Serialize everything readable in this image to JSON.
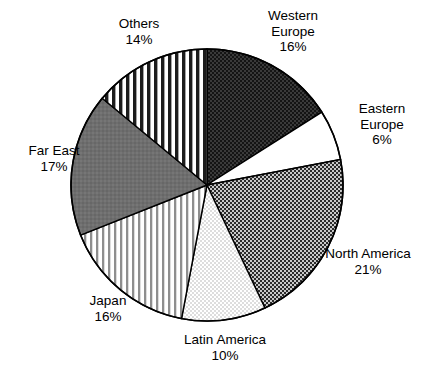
{
  "chart_data": {
    "type": "pie",
    "title": "",
    "subtitle": "",
    "xlabel": "",
    "ylabel": "",
    "legend_position": "none",
    "grid": false,
    "value_suffix": "%",
    "start_angle_deg": 0,
    "direction": "clockwise",
    "categories": [
      "Western Europe",
      "Eastern Europe",
      "North America",
      "Latin America",
      "Japan",
      "Far East",
      "Others"
    ],
    "values": [
      16,
      6,
      21,
      10,
      16,
      17,
      14
    ],
    "slices": [
      {
        "key": "western-europe",
        "label": "Western Europe",
        "label_line1": "Western",
        "label_line2": "Europe",
        "value": 16,
        "value_text": "16%",
        "fill_pattern": "dense-dark-checkerboard",
        "fill_color": "#444444",
        "start_pct": 0,
        "end_pct": 16
      },
      {
        "key": "eastern-europe",
        "label": "Eastern Europe",
        "label_line1": "Eastern",
        "label_line2": "Europe",
        "value": 6,
        "value_text": "6%",
        "fill_pattern": "solid-white",
        "fill_color": "#ffffff",
        "start_pct": 16,
        "end_pct": 22
      },
      {
        "key": "north-america",
        "label": "North America",
        "label_line1": "North America",
        "label_line2": "",
        "value": 21,
        "value_text": "21%",
        "fill_pattern": "medium-checkerboard",
        "fill_color": "#6f6f6f",
        "start_pct": 22,
        "end_pct": 43
      },
      {
        "key": "latin-america",
        "label": "Latin America",
        "label_line1": "Latin America",
        "label_line2": "",
        "value": 10,
        "value_text": "10%",
        "fill_pattern": "light-dots",
        "fill_color": "#d8d8d8",
        "start_pct": 43,
        "end_pct": 53
      },
      {
        "key": "japan",
        "label": "Japan",
        "label_line1": "Japan",
        "label_line2": "",
        "value": 16,
        "value_text": "16%",
        "fill_pattern": "thin-vertical-stripes",
        "fill_color": "#9a9a9a",
        "start_pct": 53,
        "end_pct": 69
      },
      {
        "key": "far-east",
        "label": "Far East",
        "label_line1": "Far East",
        "label_line2": "",
        "value": 17,
        "value_text": "17%",
        "fill_pattern": "solid-gray",
        "fill_color": "#6a6a6a",
        "start_pct": 69,
        "end_pct": 86
      },
      {
        "key": "others",
        "label": "Others",
        "label_line1": "Others",
        "label_line2": "",
        "value": 14,
        "value_text": "14%",
        "fill_pattern": "bold-vertical-stripes",
        "fill_color": "#2e2e2e",
        "start_pct": 86,
        "end_pct": 100
      }
    ],
    "geometry": {
      "center_x": 207,
      "center_y": 185,
      "radius": 136
    },
    "colors": {
      "outline": "#000000",
      "background": "#ffffff",
      "text": "#000000"
    }
  }
}
